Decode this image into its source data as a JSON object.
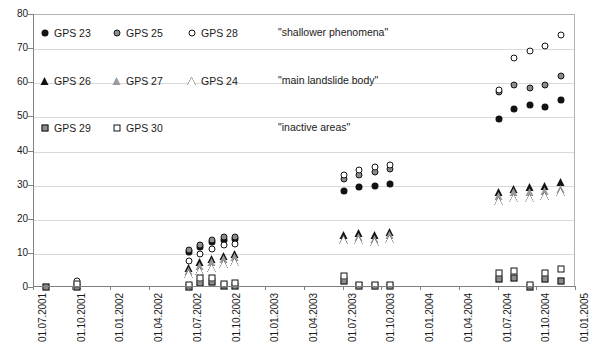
{
  "chart_data": {
    "type": "scatter",
    "title": "",
    "xlabel": "",
    "ylabel": "",
    "ylim": [
      0,
      80
    ],
    "ytick_step": 10,
    "yticks": [
      0,
      10,
      20,
      30,
      40,
      50,
      60,
      70,
      80
    ],
    "grid": true,
    "grid_axis": "y",
    "legend_position": "inside-top-left",
    "xticks": [
      "01.07.2001",
      "01.10.2001",
      "01.01.2002",
      "01.04.2002",
      "01.07.2002",
      "01.10.2002",
      "01.01.2003",
      "01.04.2003",
      "01.07.2003",
      "01.10.2003",
      "01.01.2004",
      "01.04.2004",
      "01.07.2004",
      "01.10.2004",
      "01.01.2005"
    ],
    "xlim_index": [
      0,
      14
    ],
    "legend_groups": [
      {
        "label": "\"shallower phenomena\"",
        "members": [
          "GPS 23",
          "GPS 25",
          "GPS 28"
        ]
      },
      {
        "label": "\"main landslide body\"",
        "members": [
          "GPS 26",
          "GPS 27",
          "GPS 24"
        ]
      },
      {
        "label": "\"inactive areas\"",
        "members": [
          "GPS 29",
          "GPS 30"
        ]
      }
    ],
    "series": [
      {
        "name": "GPS 23",
        "marker": "circle-filled",
        "group": "shallower phenomena",
        "points": [
          {
            "x": 1.1,
            "y": 1.0
          },
          {
            "x": 4.0,
            "y": 10.5
          },
          {
            "x": 4.3,
            "y": 12.0
          },
          {
            "x": 4.6,
            "y": 13.5
          },
          {
            "x": 4.9,
            "y": 14.0
          },
          {
            "x": 5.2,
            "y": 14.5
          },
          {
            "x": 8.0,
            "y": 28.5
          },
          {
            "x": 8.4,
            "y": 29.5
          },
          {
            "x": 8.8,
            "y": 30.0
          },
          {
            "x": 9.2,
            "y": 30.5
          },
          {
            "x": 12.0,
            "y": 49.5
          },
          {
            "x": 12.4,
            "y": 52.5
          },
          {
            "x": 12.8,
            "y": 53.5
          },
          {
            "x": 13.2,
            "y": 53.0
          },
          {
            "x": 13.6,
            "y": 55.0
          }
        ]
      },
      {
        "name": "GPS 25",
        "marker": "circle-half",
        "group": "shallower phenomena",
        "points": [
          {
            "x": 1.1,
            "y": 1.5
          },
          {
            "x": 4.0,
            "y": 11.0
          },
          {
            "x": 4.3,
            "y": 12.5
          },
          {
            "x": 4.6,
            "y": 14.0
          },
          {
            "x": 4.9,
            "y": 15.0
          },
          {
            "x": 5.2,
            "y": 15.0
          },
          {
            "x": 8.0,
            "y": 32.0
          },
          {
            "x": 8.4,
            "y": 33.0
          },
          {
            "x": 8.8,
            "y": 34.0
          },
          {
            "x": 9.2,
            "y": 35.0
          },
          {
            "x": 12.0,
            "y": 57.5
          },
          {
            "x": 12.4,
            "y": 59.5
          },
          {
            "x": 12.8,
            "y": 58.5
          },
          {
            "x": 13.2,
            "y": 59.5
          },
          {
            "x": 13.6,
            "y": 62.0
          }
        ]
      },
      {
        "name": "GPS 28",
        "marker": "circle-open",
        "group": "shallower phenomena",
        "points": [
          {
            "x": 1.1,
            "y": 2.0
          },
          {
            "x": 4.0,
            "y": 8.0
          },
          {
            "x": 4.3,
            "y": 10.0
          },
          {
            "x": 4.6,
            "y": 11.5
          },
          {
            "x": 4.9,
            "y": 12.5
          },
          {
            "x": 5.2,
            "y": 13.0
          },
          {
            "x": 8.0,
            "y": 33.0
          },
          {
            "x": 8.4,
            "y": 34.5
          },
          {
            "x": 8.8,
            "y": 35.5
          },
          {
            "x": 9.2,
            "y": 36.0
          },
          {
            "x": 12.0,
            "y": 58.0
          },
          {
            "x": 12.4,
            "y": 67.5
          },
          {
            "x": 12.8,
            "y": 69.5
          },
          {
            "x": 13.2,
            "y": 71.0
          },
          {
            "x": 13.6,
            "y": 74.0
          }
        ]
      },
      {
        "name": "GPS 26",
        "marker": "tri-filled",
        "group": "main landslide body",
        "points": [
          {
            "x": 1.1,
            "y": 0.8
          },
          {
            "x": 4.0,
            "y": 6.0
          },
          {
            "x": 4.3,
            "y": 7.5
          },
          {
            "x": 4.6,
            "y": 8.5
          },
          {
            "x": 4.9,
            "y": 9.5
          },
          {
            "x": 5.2,
            "y": 10.0
          },
          {
            "x": 8.0,
            "y": 15.5
          },
          {
            "x": 8.4,
            "y": 16.0
          },
          {
            "x": 8.8,
            "y": 15.5
          },
          {
            "x": 9.2,
            "y": 16.5
          },
          {
            "x": 12.0,
            "y": 28.0
          },
          {
            "x": 12.4,
            "y": 29.0
          },
          {
            "x": 12.8,
            "y": 29.5
          },
          {
            "x": 13.2,
            "y": 30.0
          },
          {
            "x": 13.6,
            "y": 31.0
          }
        ]
      },
      {
        "name": "GPS 27",
        "marker": "tri-half",
        "group": "main landslide body",
        "points": [
          {
            "x": 1.1,
            "y": 0.8
          },
          {
            "x": 4.0,
            "y": 5.0
          },
          {
            "x": 4.3,
            "y": 6.5
          },
          {
            "x": 4.6,
            "y": 7.5
          },
          {
            "x": 4.9,
            "y": 8.5
          },
          {
            "x": 5.2,
            "y": 9.0
          },
          {
            "x": 8.0,
            "y": 14.5
          },
          {
            "x": 8.4,
            "y": 15.0
          },
          {
            "x": 8.8,
            "y": 14.5
          },
          {
            "x": 9.2,
            "y": 15.5
          },
          {
            "x": 12.0,
            "y": 27.0
          },
          {
            "x": 12.4,
            "y": 28.0
          },
          {
            "x": 12.8,
            "y": 28.0
          },
          {
            "x": 13.2,
            "y": 28.5
          },
          {
            "x": 13.6,
            "y": 29.0
          }
        ]
      },
      {
        "name": "GPS 24",
        "marker": "tri-open",
        "group": "main landslide body",
        "points": [
          {
            "x": 1.1,
            "y": 0.8
          },
          {
            "x": 4.0,
            "y": 4.0
          },
          {
            "x": 4.3,
            "y": 5.0
          },
          {
            "x": 4.6,
            "y": 6.0
          },
          {
            "x": 4.9,
            "y": 7.0
          },
          {
            "x": 5.2,
            "y": 7.5
          },
          {
            "x": 8.0,
            "y": 14.0
          },
          {
            "x": 8.4,
            "y": 14.0
          },
          {
            "x": 8.8,
            "y": 13.5
          },
          {
            "x": 9.2,
            "y": 14.5
          },
          {
            "x": 12.0,
            "y": 25.5
          },
          {
            "x": 12.4,
            "y": 26.5
          },
          {
            "x": 12.8,
            "y": 26.5
          },
          {
            "x": 13.2,
            "y": 27.0
          },
          {
            "x": 13.6,
            "y": 28.0
          }
        ]
      },
      {
        "name": "GPS 29",
        "marker": "sq-half",
        "group": "inactive areas",
        "points": [
          {
            "x": 0.3,
            "y": 0.3
          },
          {
            "x": 1.1,
            "y": 0.4
          },
          {
            "x": 4.0,
            "y": 0.4
          },
          {
            "x": 4.3,
            "y": 1.5
          },
          {
            "x": 4.6,
            "y": 1.8
          },
          {
            "x": 4.9,
            "y": 0.5
          },
          {
            "x": 5.2,
            "y": 0.5
          },
          {
            "x": 8.0,
            "y": 2.0
          },
          {
            "x": 8.4,
            "y": 0.5
          },
          {
            "x": 8.8,
            "y": 0.5
          },
          {
            "x": 9.2,
            "y": 0.5
          },
          {
            "x": 12.0,
            "y": 2.5
          },
          {
            "x": 12.4,
            "y": 3.0
          },
          {
            "x": 12.8,
            "y": 0.4
          },
          {
            "x": 13.2,
            "y": 2.5
          },
          {
            "x": 13.6,
            "y": 2.0
          }
        ]
      },
      {
        "name": "GPS 30",
        "marker": "sq-open",
        "group": "inactive areas",
        "points": [
          {
            "x": 1.1,
            "y": 1.2
          },
          {
            "x": 4.0,
            "y": 1.0
          },
          {
            "x": 4.3,
            "y": 2.8
          },
          {
            "x": 4.6,
            "y": 3.0
          },
          {
            "x": 4.9,
            "y": 1.2
          },
          {
            "x": 5.2,
            "y": 1.5
          },
          {
            "x": 8.0,
            "y": 3.5
          },
          {
            "x": 8.4,
            "y": 0.8
          },
          {
            "x": 8.8,
            "y": 0.8
          },
          {
            "x": 9.2,
            "y": 0.8
          },
          {
            "x": 12.0,
            "y": 4.5
          },
          {
            "x": 12.4,
            "y": 5.0
          },
          {
            "x": 12.8,
            "y": 0.8
          },
          {
            "x": 13.2,
            "y": 4.5
          },
          {
            "x": 13.6,
            "y": 5.5
          }
        ]
      }
    ]
  }
}
